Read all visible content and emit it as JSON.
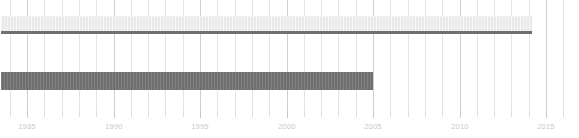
{
  "chart_data": {
    "type": "bar",
    "orientation": "horizontal",
    "title": "",
    "subtitle": "",
    "xlabel": "",
    "ylabel": "",
    "xlim": [
      1983.5,
      2017.5
    ],
    "grid": true,
    "grid_interval": 1,
    "legend": null,
    "axis": {
      "tick_labels": [
        "1985",
        "1990",
        "1995",
        "2000",
        "2005",
        "2010",
        "2015"
      ],
      "tick_values": [
        1985,
        1990,
        1995,
        2000,
        2005,
        2010,
        2015
      ],
      "minor_tick_interval": 1,
      "minor_tick_values": [
        1984,
        1985,
        1986,
        1987,
        1988,
        1989,
        1990,
        1991,
        1992,
        1993,
        1994,
        1995,
        1996,
        1997,
        1998,
        1999,
        2000,
        2001,
        2002,
        2003,
        2004,
        2005,
        2006,
        2007,
        2008,
        2009,
        2010,
        2011,
        2012,
        2013,
        2014,
        2015,
        2016,
        2017
      ]
    },
    "bars": [
      {
        "name": "top-span-bar",
        "start": 1983.5,
        "end": 2014.2,
        "color": "#e9e9e9",
        "edge_color": "#6f6f6f",
        "row": 0
      },
      {
        "name": "lower-span-bar",
        "start": 1983.5,
        "end": 2005.0,
        "color": "#6f6f6f",
        "edge_color": "#6f6f6f",
        "row": 1
      }
    ],
    "colors": {
      "background": "#ffffff",
      "gridline": "#e3e3e3",
      "gridline_major": "#cfcfcf",
      "tick_label": "#c9c9c9",
      "bar_light": "#e9e9e9",
      "bar_dark": "#6f6f6f"
    }
  }
}
